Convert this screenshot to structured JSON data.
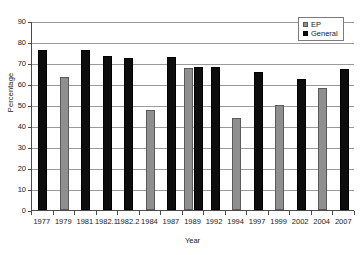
{
  "chart_data": {
    "type": "bar",
    "title": "",
    "xlabel": "Year",
    "ylabel": "Percentage",
    "ylim": [
      0,
      90
    ],
    "ytick_step": 10,
    "yticks": [
      90,
      80,
      70,
      60,
      50,
      40,
      30,
      20,
      10,
      0
    ],
    "grid": true,
    "legend_position": "top-right",
    "categories": [
      "1977",
      "1979",
      "1981",
      "1982.1",
      "1982.2",
      "1984",
      "1987",
      "1989",
      "1992",
      "1994",
      "1997",
      "1999",
      "2002",
      "2004",
      "2007"
    ],
    "series": [
      {
        "name": "EP",
        "color": "#8f8f8f",
        "values": [
          null,
          63.5,
          null,
          null,
          null,
          47.5,
          null,
          67.8,
          null,
          43.7,
          null,
          49.8,
          null,
          58.3,
          null
        ]
      },
      {
        "name": "General",
        "color": "#0d0d0d",
        "values": [
          76.0,
          null,
          76.0,
          73.5,
          72.5,
          null,
          72.8,
          68.2,
          68.2,
          null,
          65.7,
          null,
          62.2,
          null,
          67.0
        ]
      }
    ]
  },
  "legend": {
    "items": [
      {
        "label": "EP",
        "swatch": "ep"
      },
      {
        "label": "General",
        "swatch": "general"
      }
    ]
  },
  "axes": {
    "y_title": "Percentage",
    "x_title": "Year"
  }
}
